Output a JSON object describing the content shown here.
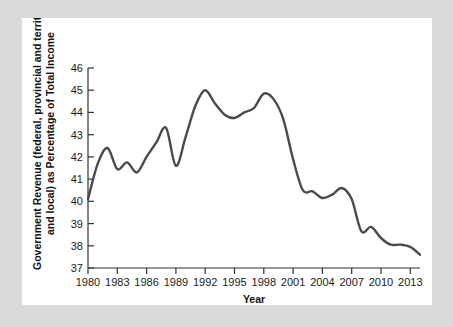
{
  "figure": {
    "panel_background": "#ffffff",
    "outer_background": "#d9d9d9",
    "line_color": "#4a4a4a",
    "axis_color": "#333333"
  },
  "axes": {
    "y_label_line1": "Government Revenue (federal, provincial and territorial,",
    "y_label_line2": "and local) as Percentage of Total Income",
    "x_label": "Year",
    "y_ticks": [
      "37",
      "38",
      "39",
      "40",
      "41",
      "42",
      "43",
      "44",
      "45",
      "46"
    ],
    "x_ticks": [
      "1980",
      "1983",
      "1986",
      "1989",
      "1992",
      "1995",
      "1998",
      "2001",
      "2004",
      "2007",
      "2010",
      "2013"
    ]
  },
  "chart_data": {
    "type": "line",
    "title": "",
    "xlabel": "Year",
    "ylabel": "Government Revenue (federal, provincial and territorial, and local) as Percentage of Total Income",
    "xlim": [
      1980,
      2014
    ],
    "ylim": [
      37,
      46
    ],
    "ytick_values": [
      37,
      38,
      39,
      40,
      41,
      42,
      43,
      44,
      45,
      46
    ],
    "xtick_values": [
      1980,
      1983,
      1986,
      1989,
      1992,
      1995,
      1998,
      2001,
      2004,
      2007,
      2010,
      2013
    ],
    "grid": false,
    "legend": null,
    "x": [
      1980,
      1981,
      1982,
      1983,
      1984,
      1985,
      1986,
      1987,
      1988,
      1989,
      1990,
      1991,
      1992,
      1993,
      1994,
      1995,
      1996,
      1997,
      1998,
      1999,
      2000,
      2001,
      2002,
      2003,
      2004,
      2005,
      2006,
      2007,
      2008,
      2009,
      2010,
      2011,
      2012,
      2013,
      2014
    ],
    "series": [
      {
        "name": "Government revenue as percentage of total income",
        "values": [
          40.1,
          41.7,
          42.4,
          41.45,
          41.75,
          41.3,
          42.0,
          42.65,
          43.3,
          41.6,
          42.9,
          44.3,
          45.0,
          44.4,
          43.9,
          43.75,
          44.0,
          44.2,
          44.85,
          44.6,
          43.7,
          41.9,
          40.5,
          40.45,
          40.15,
          40.3,
          40.6,
          40.1,
          38.65,
          38.85,
          38.35,
          38.05,
          38.05,
          37.95,
          37.6
        ]
      }
    ]
  }
}
